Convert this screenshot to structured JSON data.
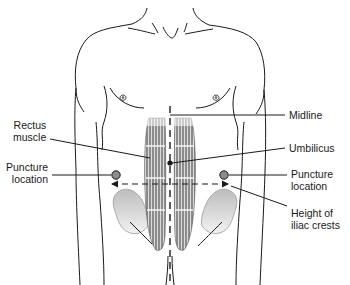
{
  "diagram": {
    "type": "anatomical-illustration",
    "labels": {
      "rectus_muscle": {
        "line1": "Rectus",
        "line2": "muscle"
      },
      "puncture_left": {
        "line1": "Puncture",
        "line2": "location"
      },
      "midline": {
        "line1": "Midline"
      },
      "umbilicus": {
        "line1": "Umbilicus"
      },
      "puncture_right": {
        "line1": "Puncture",
        "line2": "location"
      },
      "iliac_crests": {
        "line1": "Height of",
        "line2": "iliac crests"
      }
    },
    "colors": {
      "outline": "#1a1a1a",
      "muscle_fill": "#8a8a8a",
      "bone_fill": "#cfcfcf",
      "puncture_marker": "#8c8c8c"
    }
  }
}
